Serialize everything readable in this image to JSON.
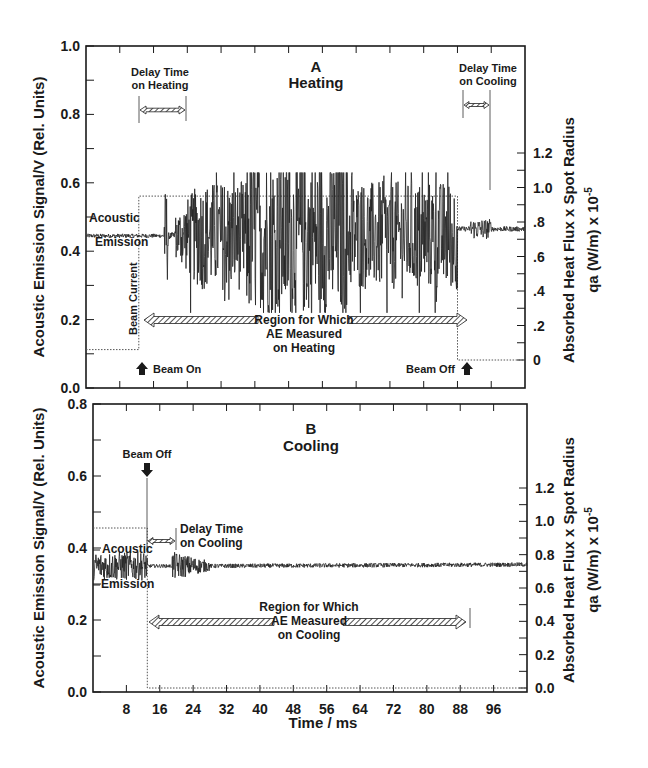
{
  "figure": {
    "xlabel": "Time / ms",
    "x_ticks": [
      8,
      16,
      24,
      32,
      40,
      48,
      56,
      64,
      72,
      80,
      88,
      96
    ],
    "xlim": [
      0,
      104
    ],
    "colors": {
      "ink": "#1a1a1a",
      "trace": "#222222",
      "dotted": "#555555",
      "background": "#ffffff"
    }
  },
  "panels": [
    {
      "id": "A",
      "letter": "A",
      "title": "Heating",
      "left_ylabel": "Acoustic Emission Signal/V (Rel. Units)",
      "left_yticks": [
        "0.0",
        "0.2",
        "0.4",
        "0.6",
        "0.8",
        "1.0"
      ],
      "left_ylim": [
        0,
        1.0
      ],
      "right_ylabel_1": "Absorbed Heat Flux x Spot Radius",
      "right_ylabel_2": "qa (W/m) x 10",
      "right_ylabel_exp": "-5",
      "right_yticks": [
        "0",
        ".2",
        ".4",
        ".6",
        ".8",
        "1.0",
        "1.2"
      ],
      "right_ylim": [
        0,
        1.2
      ],
      "labels": {
        "acoustic": "Acoustic",
        "emission": "Emission",
        "beam_current": "Beam Current",
        "beam_on": "Beam On",
        "beam_off": "Beam Off",
        "delay_heating_1": "Delay Time",
        "delay_heating_2": "on Heating",
        "delay_cooling_1": "Delay Time",
        "delay_cooling_2": "on Cooling",
        "region_1": "Region for Which",
        "region_2": "AE Measured",
        "region_3": "on Heating"
      }
    },
    {
      "id": "B",
      "letter": "B",
      "title": "Cooling",
      "left_ylabel": "Acoustic Emission Signal/V (Rel. Units)",
      "left_yticks": [
        "0.0",
        "0.2",
        "0.4",
        "0.6",
        "0.8"
      ],
      "left_ylim": [
        0,
        0.8
      ],
      "right_ylabel_1": "Absorbed Heat Flux x Spot Radius",
      "right_ylabel_2": "qa (W/m) x 10",
      "right_ylabel_exp": "-5",
      "right_yticks": [
        "0.0",
        "0.2",
        "0.4",
        "0.6",
        "0.8",
        "1.0",
        "1.2"
      ],
      "right_ylim": [
        0,
        1.2
      ],
      "labels": {
        "acoustic": "Acoustic",
        "emission": "Emission",
        "beam_off": "Beam Off",
        "delay_cooling_1": "Delay Time",
        "delay_cooling_2": "on Cooling",
        "region_1": "Region for Which",
        "region_2": "AE Measured",
        "region_3": "on Cooling"
      }
    }
  ],
  "chart_data": [
    {
      "type": "line",
      "title": "A Heating",
      "xlabel": "Time / ms",
      "ylabel": "Acoustic Emission Signal/V (Rel. Units)",
      "y2label": "Absorbed Heat Flux x Spot Radius, qa (W/m) x 10^-5",
      "xlim": [
        0,
        104
      ],
      "ylim": [
        0,
        1.0
      ],
      "y2lim": [
        0,
        1.2
      ],
      "x_ticks": [
        8,
        16,
        24,
        32,
        40,
        48,
        56,
        64,
        72,
        80,
        88,
        96
      ],
      "grid": false,
      "series": [
        {
          "name": "Acoustic Emission",
          "axis": "left",
          "description": "baseline ~0.445 with small noise until ~19 ms; spike at ~19 ms (0.25-0.53); strong bursts 21-88 ms with envelope ~0.28-0.62; baseline ~0.465 after 88 ms with small burst ~92-96 ms",
          "baseline_before": 0.445,
          "baseline_after": 0.465,
          "burst_range_ms": [
            21,
            88
          ],
          "burst_envelope": [
            0.25,
            0.62
          ],
          "max_spike": 0.63,
          "min_spike": 0.22
        },
        {
          "name": "Beam Current / Absorbed Heat Flux",
          "axis": "right",
          "style": "dotted",
          "x": [
            0,
            12.5,
            12.5,
            88,
            88,
            104
          ],
          "y": [
            0.06,
            0.06,
            0.95,
            0.95,
            0.0,
            0.0
          ]
        }
      ],
      "annotations": [
        {
          "text": "Beam On",
          "x": 12.5,
          "arrow": "up"
        },
        {
          "text": "Beam Off",
          "x": 88,
          "arrow": "up"
        },
        {
          "text": "Delay Time on Heating",
          "x_range": [
            12.5,
            19.5
          ]
        },
        {
          "text": "Delay Time on Cooling",
          "x_range": [
            88,
            94
          ]
        },
        {
          "text": "Region for Which AE Measured on Heating",
          "x_range": [
            12.5,
            88
          ]
        },
        {
          "text": "Beam Current",
          "x": 12.5,
          "rotated": true
        },
        {
          "text": "Acoustic Emission",
          "x": 1
        }
      ]
    },
    {
      "type": "line",
      "title": "B Cooling",
      "xlabel": "Time / ms",
      "ylabel": "Acoustic Emission Signal/V (Rel. Units)",
      "y2label": "Absorbed Heat Flux x Spot Radius, qa (W/m) x 10^-5",
      "xlim": [
        0,
        104
      ],
      "ylim": [
        0,
        0.8
      ],
      "y2lim": [
        0,
        1.2
      ],
      "x_ticks": [
        8,
        16,
        24,
        32,
        40,
        48,
        56,
        64,
        72,
        80,
        88,
        96
      ],
      "grid": false,
      "series": [
        {
          "name": "Acoustic Emission",
          "axis": "left",
          "description": "noisy ~0.35 (0.31-0.39) before beam off at ~13 ms; quiet ~0.35 13-19 ms; burst 19-28 ms (0.31-0.39); then slowly decaying noise ~0.355 to 104 ms",
          "baseline": 0.35,
          "burst_range_ms": [
            19,
            28
          ],
          "burst_envelope": [
            0.31,
            0.39
          ]
        },
        {
          "name": "Beam Current / Absorbed Heat Flux",
          "axis": "right",
          "style": "dotted",
          "x": [
            0,
            13,
            13,
            104
          ],
          "y": [
            0.96,
            0.96,
            0.0,
            0.0
          ]
        }
      ],
      "annotations": [
        {
          "text": "Beam Off",
          "x": 13,
          "arrow": "down"
        },
        {
          "text": "Delay Time on Cooling",
          "x_range": [
            13,
            20
          ]
        },
        {
          "text": "Region for Which AE Measured on Cooling",
          "x_range": [
            13,
            88
          ]
        },
        {
          "text": "Acoustic Emission",
          "x": 1
        }
      ]
    }
  ]
}
